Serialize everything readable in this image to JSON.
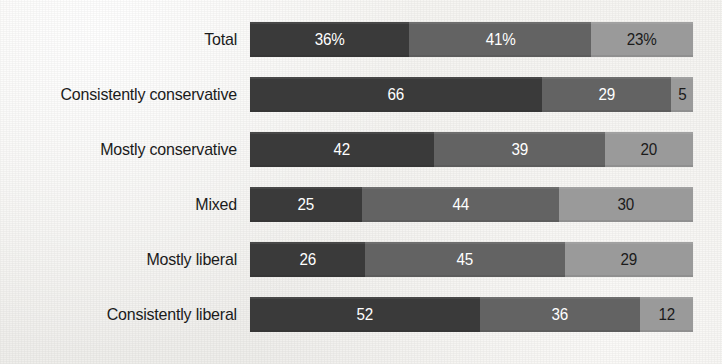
{
  "chart_data": {
    "type": "bar",
    "subtype": "horizontal-stacked-bar",
    "title": "",
    "subtitle": "",
    "xlabel": "",
    "ylabel": "",
    "xlim": [
      0,
      100
    ],
    "grid": false,
    "legend_position": "none",
    "stacked": true,
    "orientation": "horizontal",
    "value_suffix_first_row": "%",
    "categories": [
      "Total",
      "Consistently conservative",
      "Mostly conservative",
      "Mixed",
      "Mostly liberal",
      "Consistently liberal"
    ],
    "series": [
      {
        "name": "segment-1",
        "color": "#3a3a3a",
        "values": [
          36,
          66,
          42,
          25,
          26,
          52
        ]
      },
      {
        "name": "segment-2",
        "color": "#636363",
        "values": [
          41,
          29,
          39,
          44,
          45,
          36
        ]
      },
      {
        "name": "segment-3",
        "color": "#9a9a9a",
        "values": [
          23,
          5,
          20,
          30,
          29,
          12
        ]
      }
    ],
    "rows": [
      {
        "label": "Total",
        "segments": [
          {
            "value": 36,
            "label": "36%",
            "color": "#3a3a3a"
          },
          {
            "value": 41,
            "label": "41%",
            "color": "#636363"
          },
          {
            "value": 23,
            "label": "23%",
            "color": "#9a9a9a"
          }
        ]
      },
      {
        "label": "Consistently conservative",
        "segments": [
          {
            "value": 66,
            "label": "66",
            "color": "#3a3a3a"
          },
          {
            "value": 29,
            "label": "29",
            "color": "#636363"
          },
          {
            "value": 5,
            "label": "5",
            "color": "#9a9a9a"
          }
        ]
      },
      {
        "label": "Mostly conservative",
        "segments": [
          {
            "value": 42,
            "label": "42",
            "color": "#3a3a3a"
          },
          {
            "value": 39,
            "label": "39",
            "color": "#636363"
          },
          {
            "value": 20,
            "label": "20",
            "color": "#9a9a9a"
          }
        ]
      },
      {
        "label": "Mixed",
        "segments": [
          {
            "value": 25,
            "label": "25",
            "color": "#3a3a3a"
          },
          {
            "value": 44,
            "label": "44",
            "color": "#636363"
          },
          {
            "value": 30,
            "label": "30",
            "color": "#9a9a9a"
          }
        ]
      },
      {
        "label": "Mostly liberal",
        "segments": [
          {
            "value": 26,
            "label": "26",
            "color": "#3a3a3a"
          },
          {
            "value": 45,
            "label": "45",
            "color": "#636363"
          },
          {
            "value": 29,
            "label": "29",
            "color": "#9a9a9a"
          }
        ]
      },
      {
        "label": "Consistently liberal",
        "segments": [
          {
            "value": 52,
            "label": "52",
            "color": "#3a3a3a"
          },
          {
            "value": 36,
            "label": "36",
            "color": "#636363"
          },
          {
            "value": 12,
            "label": "12",
            "color": "#9a9a9a"
          }
        ]
      }
    ],
    "colors": {
      "background": "#f4f3f0",
      "segment_dark": "#3a3a3a",
      "segment_medium": "#636363",
      "segment_light": "#9a9a9a",
      "label_text": "#1b1b1b",
      "value_text_on_dark": "#ffffff",
      "value_text_on_light": "#1b1b1b"
    },
    "layout": {
      "bar_left_px": 250,
      "bar_width_px": 443,
      "bar_height_px": 35,
      "row_pitch_px": 55,
      "first_row_top_px": 22,
      "label_right_px": 237
    }
  }
}
